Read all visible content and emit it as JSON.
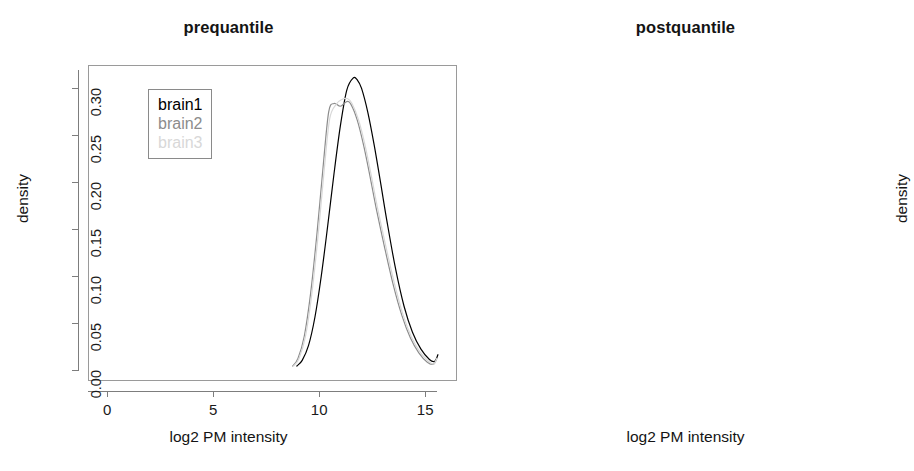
{
  "figure": {
    "width": 914,
    "height": 471,
    "background": "#ffffff"
  },
  "panels": [
    {
      "id": "prequantile",
      "title": "prequantile",
      "xlabel": "log2 PM intensity",
      "ylabel": "density"
    },
    {
      "id": "postquantile",
      "title": "postquantile",
      "xlabel": "log2 PM intensity",
      "ylabel": "density"
    }
  ],
  "legend": {
    "entries": [
      {
        "label": "brain1",
        "color": "#000000"
      },
      {
        "label": "brain2",
        "color": "#8c8c8c"
      },
      {
        "label": "brain3",
        "color": "#d8d8d8"
      }
    ]
  },
  "axis": {
    "x_ticks": [
      "0",
      "5",
      "10",
      "15"
    ],
    "y_ticks": [
      "0.00",
      "0.05",
      "0.10",
      "0.15",
      "0.20",
      "0.25",
      "0.30"
    ]
  },
  "chart_data": [
    {
      "type": "line",
      "title": "prequantile",
      "xlabel": "log2 PM intensity",
      "ylabel": "density",
      "xlim": [
        -0.9,
        16.5
      ],
      "ylim": [
        -0.012,
        0.325
      ],
      "xticks": [
        0,
        5,
        10,
        15
      ],
      "yticks": [
        0.0,
        0.05,
        0.1,
        0.15,
        0.2,
        0.25,
        0.3
      ],
      "grid": false,
      "legend_position": "upper-left",
      "series": [
        {
          "name": "brain1",
          "color": "#000000",
          "x": [
            8.95,
            9.2,
            9.5,
            9.8,
            10.1,
            10.4,
            10.7,
            11.0,
            11.3,
            11.6,
            11.8,
            12.0,
            12.3,
            12.6,
            12.9,
            13.2,
            13.6,
            14.0,
            14.4,
            14.8,
            15.2,
            15.45,
            15.6
          ],
          "y": [
            0.004,
            0.01,
            0.026,
            0.056,
            0.1,
            0.153,
            0.209,
            0.26,
            0.298,
            0.311,
            0.309,
            0.3,
            0.274,
            0.239,
            0.199,
            0.158,
            0.108,
            0.068,
            0.04,
            0.022,
            0.011,
            0.009,
            0.016
          ]
        },
        {
          "name": "brain2",
          "color": "#8c8c8c",
          "x": [
            8.75,
            9.0,
            9.3,
            9.6,
            9.9,
            10.2,
            10.45,
            10.7,
            11.0,
            11.3,
            11.5,
            11.8,
            12.1,
            12.4,
            12.7,
            13.1,
            13.5,
            13.9,
            14.3,
            14.7,
            15.1,
            15.4,
            15.55
          ],
          "y": [
            0.004,
            0.012,
            0.036,
            0.082,
            0.146,
            0.22,
            0.275,
            0.284,
            0.281,
            0.286,
            0.283,
            0.266,
            0.239,
            0.206,
            0.171,
            0.129,
            0.09,
            0.058,
            0.034,
            0.018,
            0.008,
            0.006,
            0.012
          ]
        },
        {
          "name": "brain3",
          "color": "#d8d8d8",
          "x": [
            8.8,
            9.05,
            9.35,
            9.65,
            9.95,
            10.25,
            10.5,
            10.8,
            11.05,
            11.35,
            11.55,
            11.85,
            12.15,
            12.45,
            12.75,
            13.15,
            13.55,
            13.95,
            14.35,
            14.75,
            15.15,
            15.4,
            15.55
          ],
          "y": [
            0.004,
            0.012,
            0.035,
            0.08,
            0.143,
            0.216,
            0.268,
            0.283,
            0.288,
            0.289,
            0.284,
            0.267,
            0.241,
            0.208,
            0.173,
            0.131,
            0.092,
            0.059,
            0.035,
            0.019,
            0.009,
            0.006,
            0.012
          ]
        }
      ]
    },
    {
      "type": "line",
      "title": "postquantile",
      "xlabel": "log2 PM intensity",
      "ylabel": "density",
      "xlim": [
        -0.9,
        16.5
      ],
      "ylim": [
        -0.012,
        0.325
      ],
      "xticks": [
        0,
        5,
        10,
        15
      ],
      "yticks": [
        0.0,
        0.05,
        0.1,
        0.15,
        0.2,
        0.25,
        0.3
      ],
      "grid": false,
      "legend_position": "upper-left",
      "note": "all three density curves coincide after quantile normalization",
      "series": [
        {
          "name": "brain1",
          "color": "#bdbdbd",
          "x": [
            8.95,
            9.2,
            9.5,
            9.8,
            10.1,
            10.4,
            10.7,
            11.0,
            11.25,
            11.5,
            11.65,
            11.9,
            12.2,
            12.5,
            12.8,
            13.2,
            13.6,
            14.0,
            14.4,
            14.8,
            15.2,
            15.5,
            15.65
          ],
          "y": [
            0.003,
            0.01,
            0.03,
            0.07,
            0.13,
            0.2,
            0.258,
            0.285,
            0.292,
            0.299,
            0.3,
            0.291,
            0.266,
            0.232,
            0.193,
            0.145,
            0.1,
            0.063,
            0.036,
            0.018,
            0.008,
            0.005,
            0.005
          ]
        },
        {
          "name": "brain2",
          "color": "#bdbdbd",
          "x": [
            8.95,
            9.2,
            9.5,
            9.8,
            10.1,
            10.4,
            10.7,
            11.0,
            11.25,
            11.5,
            11.65,
            11.9,
            12.2,
            12.5,
            12.8,
            13.2,
            13.6,
            14.0,
            14.4,
            14.8,
            15.2,
            15.5,
            15.65
          ],
          "y": [
            0.003,
            0.01,
            0.03,
            0.07,
            0.13,
            0.2,
            0.258,
            0.285,
            0.292,
            0.299,
            0.3,
            0.291,
            0.266,
            0.232,
            0.193,
            0.145,
            0.1,
            0.063,
            0.036,
            0.018,
            0.008,
            0.005,
            0.005
          ]
        },
        {
          "name": "brain3",
          "color": "#cfcfcf",
          "x": [
            8.95,
            9.2,
            9.5,
            9.8,
            10.1,
            10.4,
            10.7,
            11.0,
            11.25,
            11.5,
            11.65,
            11.9,
            12.2,
            12.5,
            12.8,
            13.2,
            13.6,
            14.0,
            14.4,
            14.8,
            15.2,
            15.5,
            15.65
          ],
          "y": [
            0.003,
            0.01,
            0.03,
            0.07,
            0.13,
            0.2,
            0.258,
            0.285,
            0.292,
            0.299,
            0.3,
            0.291,
            0.266,
            0.232,
            0.193,
            0.145,
            0.1,
            0.063,
            0.036,
            0.018,
            0.008,
            0.005,
            0.005
          ]
        }
      ]
    }
  ]
}
